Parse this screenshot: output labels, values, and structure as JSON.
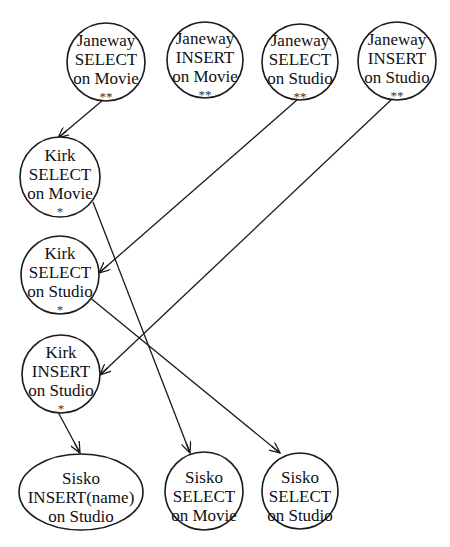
{
  "diagram": {
    "type": "precedence-graph",
    "colors": {
      "stroke": "#1a1a1a",
      "text": "#111111",
      "background": "#ffffff"
    },
    "nodes": [
      {
        "id": "janeway-select-movie",
        "user": "Janeway",
        "action": "SELECT",
        "target": "on Movie",
        "mark": "**",
        "shape": "circle",
        "cx": 106,
        "cy": 62,
        "r": 39
      },
      {
        "id": "janeway-insert-movie",
        "user": "Janeway",
        "action": "INSERT",
        "target": "on Movie",
        "mark": "**",
        "shape": "circle",
        "cx": 205,
        "cy": 60,
        "r": 38
      },
      {
        "id": "janeway-select-studio",
        "user": "Janeway",
        "action": "SELECT",
        "target": "on Studio",
        "mark": "**",
        "shape": "circle",
        "cx": 300,
        "cy": 62,
        "r": 38
      },
      {
        "id": "janeway-insert-studio",
        "user": "Janeway",
        "action": "INSERT",
        "target": "on Studio",
        "mark": "**",
        "shape": "circle",
        "cx": 397,
        "cy": 61,
        "r": 39
      },
      {
        "id": "kirk-select-movie",
        "user": "Kirk",
        "action": "SELECT",
        "target": "on Movie",
        "mark": "*",
        "shape": "circle",
        "cx": 60,
        "cy": 177,
        "r": 40
      },
      {
        "id": "kirk-select-studio",
        "user": "Kirk",
        "action": "SELECT",
        "target": "on Studio",
        "mark": "*",
        "shape": "circle",
        "cx": 60,
        "cy": 275,
        "r": 39
      },
      {
        "id": "kirk-insert-studio",
        "user": "Kirk",
        "action": "INSERT",
        "target": "on Studio",
        "mark": "*",
        "shape": "circle",
        "cx": 61,
        "cy": 374,
        "r": 39
      },
      {
        "id": "sisko-insert-name-studio",
        "user": "Sisko",
        "action": "INSERT(name)",
        "target": "on Studio",
        "mark": "",
        "shape": "ellipse",
        "cx": 81,
        "cy": 492,
        "rx": 62,
        "ry": 38
      },
      {
        "id": "sisko-select-movie",
        "user": "Sisko",
        "action": "SELECT",
        "target": "on Movie",
        "mark": "",
        "shape": "circle",
        "cx": 204,
        "cy": 491,
        "r": 39
      },
      {
        "id": "sisko-select-studio",
        "user": "Sisko",
        "action": "SELECT",
        "target": "on Studio",
        "mark": "",
        "shape": "circle",
        "cx": 300,
        "cy": 491,
        "r": 38
      }
    ],
    "edges": [
      {
        "from": "janeway-select-movie",
        "to": "kirk-select-movie",
        "x1": 103,
        "y1": 100,
        "x2": 58,
        "y2": 138
      },
      {
        "from": "janeway-select-studio",
        "to": "kirk-select-studio",
        "x1": 297,
        "y1": 100,
        "x2": 99,
        "y2": 273
      },
      {
        "from": "janeway-insert-studio",
        "to": "kirk-insert-studio",
        "x1": 392,
        "y1": 99,
        "x2": 100,
        "y2": 375
      },
      {
        "from": "kirk-select-movie",
        "to": "sisko-select-movie",
        "x1": 93,
        "y1": 202,
        "x2": 190,
        "y2": 453
      },
      {
        "from": "kirk-select-studio",
        "to": "sisko-select-studio",
        "x1": 88,
        "y1": 296,
        "x2": 280,
        "y2": 453
      },
      {
        "from": "kirk-insert-studio",
        "to": "sisko-insert-name-studio",
        "x1": 58,
        "y1": 412,
        "x2": 80,
        "y2": 453
      }
    ]
  }
}
